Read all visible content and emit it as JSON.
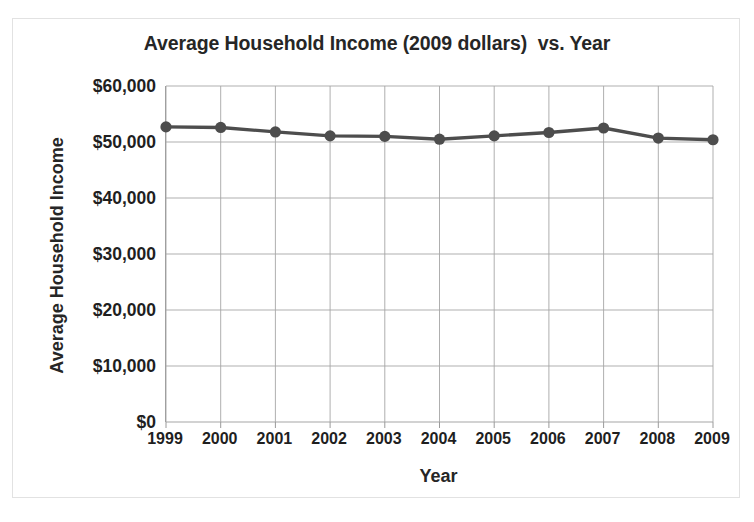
{
  "chart_data": {
    "type": "line",
    "title": "Average Household Income (2009 dollars)  vs. Year",
    "xlabel": "Year",
    "ylabel": "Average Household Income",
    "categories": [
      "1999",
      "2000",
      "2001",
      "2002",
      "2003",
      "2004",
      "2005",
      "2006",
      "2007",
      "2008",
      "2009"
    ],
    "x": [
      1999,
      2000,
      2001,
      2002,
      2003,
      2004,
      2005,
      2006,
      2007,
      2008,
      2009
    ],
    "values": [
      52700,
      52600,
      51800,
      51100,
      51000,
      50500,
      51100,
      51700,
      52500,
      50700,
      50400
    ],
    "series": [
      {
        "name": "Average Household Income",
        "values": [
          52700,
          52600,
          51800,
          51100,
          51000,
          50500,
          51100,
          51700,
          52500,
          50700,
          50400
        ]
      }
    ],
    "ylim": [
      0,
      60000
    ],
    "ytick_values": [
      0,
      10000,
      20000,
      30000,
      40000,
      50000,
      60000
    ],
    "ytick_labels": [
      "$0",
      "$10,000",
      "$20,000",
      "$30,000",
      "$40,000",
      "$50,000",
      "$60,000"
    ],
    "xtick_labels": [
      "1999",
      "2000",
      "2001",
      "2002",
      "2003",
      "2004",
      "2005",
      "2006",
      "2007",
      "2008",
      "2009"
    ],
    "grid": "both",
    "legend": "none",
    "line_color": "#4d4d4d",
    "marker": "circle",
    "marker_color": "#4d4d4d",
    "gridline_color": "#a6a6a6",
    "axis_color": "#9a9a9a",
    "background_color": "#ffffff",
    "text_color": "#262626"
  }
}
